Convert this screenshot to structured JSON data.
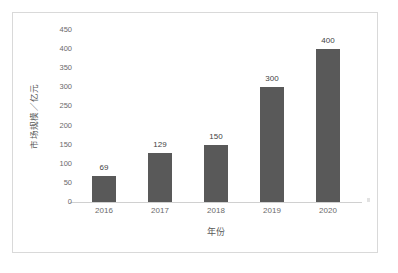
{
  "chart_data": {
    "type": "bar",
    "title": "",
    "subtitle": "",
    "categories": [
      "2016",
      "2017",
      "2018",
      "2019",
      "2020"
    ],
    "values": [
      69,
      129,
      150,
      300,
      400
    ],
    "data_labels": [
      "69",
      "129",
      "150",
      "300",
      "400"
    ],
    "xlabel": "年份",
    "ylabel": "市场规模／亿元",
    "ylim": [
      0,
      450
    ],
    "yticks": [
      0,
      50,
      100,
      150,
      200,
      250,
      300,
      350,
      400,
      450
    ],
    "ytick_labels": [
      "0",
      "50",
      "100",
      "150",
      "200",
      "250",
      "300",
      "350",
      "400",
      "450"
    ],
    "grid": false,
    "legend": null,
    "legend_position": "none",
    "series": [
      {
        "name": "市场规模",
        "values": [
          69,
          129,
          150,
          300,
          400
        ]
      }
    ],
    "colors": {
      "bar_fill": "#595959",
      "axis_line": "#d0d0d0",
      "tick_text": "#6a6a6a",
      "label_text": "#3f3f3f",
      "axis_title": "#5a5a5a",
      "border": "#d9d9d9",
      "background": "#ffffff"
    }
  }
}
